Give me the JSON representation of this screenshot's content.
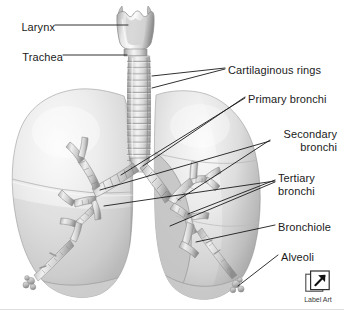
{
  "figure": {
    "width": 344,
    "height": 314,
    "background_color": "#ffffff"
  },
  "labels": [
    {
      "id": "larynx",
      "text": "Larynx",
      "side": "left",
      "x": 8,
      "y": 21
    },
    {
      "id": "trachea",
      "text": "Trachea",
      "side": "left",
      "x": 8,
      "y": 51
    },
    {
      "id": "cartilaginous-rings",
      "text": "Cartilaginous rings",
      "side": "right",
      "x": 228,
      "y": 64
    },
    {
      "id": "primary-bronchi",
      "text": "Primary bronchi",
      "side": "right",
      "x": 248,
      "y": 93
    },
    {
      "id": "secondary-bronchi",
      "text": "Secondary\nbronchi",
      "side": "right",
      "x": 273,
      "y": 128
    },
    {
      "id": "tertiary-bronchi",
      "text": "Tertiary\nbronchi",
      "side": "right",
      "x": 278,
      "y": 172
    },
    {
      "id": "bronchiole",
      "text": "Bronchiole",
      "side": "right",
      "x": 278,
      "y": 221
    },
    {
      "id": "alveoli",
      "text": "Alveoli",
      "side": "right",
      "x": 281,
      "y": 251
    }
  ],
  "anatomy_parts": [
    {
      "id": "larynx",
      "name": "Larynx"
    },
    {
      "id": "trachea",
      "name": "Trachea"
    },
    {
      "id": "cartilage-rings",
      "name": "Cartilaginous rings"
    },
    {
      "id": "primary-bronchus",
      "name": "Primary bronchi"
    },
    {
      "id": "secondary-bronchus",
      "name": "Secondary bronchi"
    },
    {
      "id": "tertiary-bronchus",
      "name": "Tertiary bronchi"
    },
    {
      "id": "bronchiole",
      "name": "Bronchiole"
    },
    {
      "id": "alveoli",
      "name": "Alveoli"
    },
    {
      "id": "left-lung",
      "name": "Left lung"
    },
    {
      "id": "right-lung",
      "name": "Right lung"
    }
  ],
  "label_art": {
    "caption": "Label Art",
    "icon": "diagonal-arrow-icon"
  },
  "colors": {
    "leader_line": "#1b1b1b",
    "text": "#1b1b1b",
    "lung_light": "#f2f2f2",
    "lung_mid": "#d8d8d8",
    "lung_shadow": "#b4b4b4",
    "airway_light": "#ededed",
    "airway_mid": "#c9c9c9",
    "airway_dark": "#8f8f8f",
    "rule": "#dedede"
  }
}
